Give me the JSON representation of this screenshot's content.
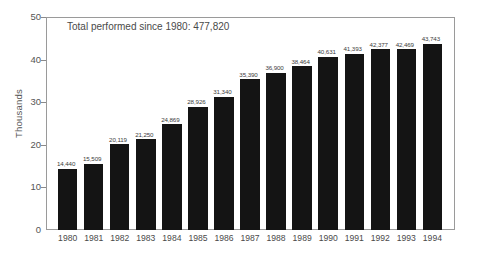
{
  "chart_data": {
    "type": "bar",
    "title": "",
    "subtitle": "",
    "xlabel": "",
    "ylabel": "Thousands",
    "ylim": [
      0,
      50
    ],
    "yticks": [
      0,
      10,
      20,
      30,
      40,
      50
    ],
    "ytick_labels": [
      "0",
      "10",
      "20",
      "30",
      "40",
      "50"
    ],
    "grid": false,
    "legend": null,
    "bar_color": "#141414",
    "categories": [
      "1980",
      "1981",
      "1982",
      "1983",
      "1984",
      "1985",
      "1986",
      "1987",
      "1988",
      "1989",
      "1990",
      "1991",
      "1992",
      "1993",
      "1994"
    ],
    "values": [
      14440,
      15509,
      20119,
      21250,
      24869,
      28926,
      31340,
      35390,
      36900,
      38464,
      40631,
      41393,
      42377,
      42469,
      43743
    ],
    "value_labels": [
      "14,440",
      "15,509",
      "20,119",
      "21,250",
      "24,869",
      "28,926",
      "31,340",
      "35,390",
      "36,900",
      "38,464",
      "40,631",
      "41,393",
      "42,377",
      "42,469",
      "43,743"
    ],
    "annotations": [
      {
        "name": "total-performed",
        "text": "Total performed since 1980: 477,820"
      }
    ]
  }
}
